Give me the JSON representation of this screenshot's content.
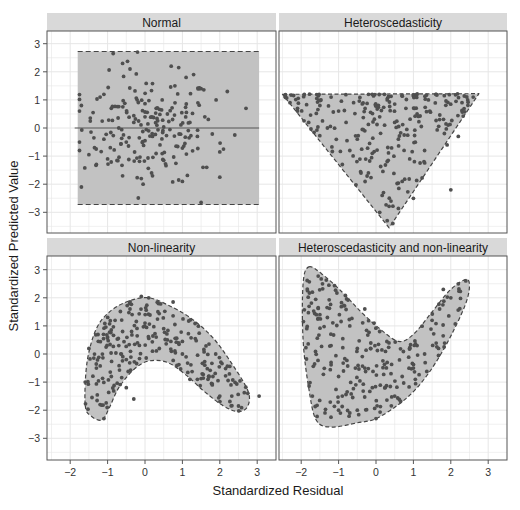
{
  "chart_data": {
    "type": "scatter",
    "layout": "facet_grid_2x2",
    "xlabel": "Standardized Residual",
    "ylabel": "Standardized Predicted Value",
    "x_ticks": [
      -2,
      -1,
      0,
      1,
      2,
      3
    ],
    "y_ticks": [
      3,
      2,
      1,
      0,
      -1,
      -2,
      -3
    ],
    "xlim": [
      -2.6,
      3.5
    ],
    "ylim": [
      -3.7,
      3.45
    ],
    "grid": true,
    "colors": {
      "strip_bg": "#d9d9d9",
      "grid": "#e6e6e6",
      "panel_border": "#555555",
      "region_fill": "#c2c2c2",
      "region_border": "#444444",
      "point": "#4f4f4f",
      "zero_line": "#555555"
    },
    "panels": [
      {
        "title": "Normal",
        "region_shape": "rectangle",
        "region": [
          [
            -1.8,
            2.72
          ],
          [
            3.05,
            2.72
          ],
          [
            3.05,
            -2.72
          ],
          [
            -1.8,
            -2.72
          ]
        ],
        "zero_line": true,
        "n_points": 220,
        "sample_points": [
          [
            -1.75,
            0.6
          ],
          [
            -1.7,
            0.8
          ],
          [
            -1.7,
            -2.1
          ],
          [
            -1.2,
            1.1
          ],
          [
            -1.1,
            1.2
          ],
          [
            -0.85,
            2.65
          ],
          [
            -0.6,
            2.3
          ],
          [
            -0.2,
            2.7
          ],
          [
            -0.4,
            2.1
          ],
          [
            0.7,
            2.2
          ],
          [
            0.9,
            2.15
          ],
          [
            1.3,
            1.9
          ],
          [
            1.1,
            1.8
          ],
          [
            0.8,
            1.5
          ],
          [
            1.5,
            1.4
          ],
          [
            2.7,
            0.7
          ],
          [
            2.2,
            1.3
          ],
          [
            1.9,
            1.0
          ],
          [
            2.4,
            -0.25
          ],
          [
            2.0,
            -0.85
          ],
          [
            2.1,
            -0.75
          ],
          [
            2.0,
            -1.75
          ],
          [
            1.65,
            -1.4
          ],
          [
            1.55,
            -1.4
          ],
          [
            0.9,
            -1.85
          ],
          [
            1.0,
            -1.9
          ],
          [
            -0.05,
            -2.0
          ],
          [
            -0.1,
            -1.8
          ],
          [
            0.2,
            -1.7
          ],
          [
            -0.6,
            -1.7
          ],
          [
            -1.3,
            -1.3
          ],
          [
            -1.5,
            -0.95
          ],
          [
            -1.35,
            -0.7
          ],
          [
            -1.0,
            -1.1
          ],
          [
            0.5,
            -1.15
          ],
          [
            1.5,
            -2.65
          ],
          [
            0.3,
            0.7
          ],
          [
            -0.3,
            0.2
          ],
          [
            0.1,
            -0.1
          ],
          [
            0.6,
            0.5
          ],
          [
            -0.7,
            0.0
          ],
          [
            1.2,
            0.2
          ],
          [
            0.4,
            -0.6
          ],
          [
            -0.5,
            -0.5
          ],
          [
            1.4,
            -0.3
          ],
          [
            -0.9,
            0.7
          ],
          [
            0.0,
            0.4
          ],
          [
            0.2,
            -0.3
          ],
          [
            -1.1,
            -0.4
          ],
          [
            1.6,
            0.4
          ]
        ]
      },
      {
        "title": "Heteroscedasticity",
        "region_shape": "inverted_triangle",
        "region": [
          [
            -2.5,
            1.2
          ],
          [
            2.75,
            1.22
          ],
          [
            0.35,
            -3.55
          ]
        ],
        "n_points": 250,
        "sample_points": [
          [
            -2.3,
            0.9
          ],
          [
            -2.1,
            0.7
          ],
          [
            -1.8,
            0.2
          ],
          [
            -1.5,
            0.8
          ],
          [
            -1.2,
            1.1
          ],
          [
            -1.0,
            0.6
          ],
          [
            -0.8,
            0.2
          ],
          [
            -0.5,
            -0.4
          ],
          [
            -0.7,
            -0.8
          ],
          [
            -0.9,
            -1.3
          ],
          [
            -0.4,
            -1.6
          ],
          [
            -0.1,
            -0.9
          ],
          [
            0.1,
            0.4
          ],
          [
            0.3,
            1.0
          ],
          [
            0.5,
            0.2
          ],
          [
            0.8,
            0.7
          ],
          [
            1.1,
            0.5
          ],
          [
            1.4,
            1.0
          ],
          [
            1.7,
            0.3
          ],
          [
            2.3,
            0.9
          ],
          [
            2.6,
            1.1
          ],
          [
            2.2,
            -0.3
          ],
          [
            1.9,
            -0.6
          ],
          [
            1.3,
            -0.8
          ],
          [
            0.9,
            -1.1
          ],
          [
            0.6,
            -0.4
          ],
          [
            0.2,
            -2.3
          ],
          [
            0.4,
            -2.6
          ],
          [
            0.1,
            -3.0
          ],
          [
            0.3,
            -3.3
          ],
          [
            0.45,
            -3.4
          ],
          [
            2.0,
            -2.2
          ],
          [
            -0.2,
            1.2
          ],
          [
            0.0,
            0.8
          ],
          [
            -1.3,
            0.0
          ],
          [
            -0.3,
            -0.1
          ],
          [
            0.7,
            -1.9
          ],
          [
            1.0,
            -2.5
          ],
          [
            -0.6,
            0.9
          ],
          [
            1.6,
            1.2
          ]
        ]
      },
      {
        "title": "Non-linearity",
        "region_shape": "curved_band_arch",
        "region": [
          [
            -1.6,
            -1.8
          ],
          [
            -1.55,
            -0.3
          ],
          [
            -1.3,
            0.9
          ],
          [
            -0.9,
            1.55
          ],
          [
            -0.4,
            1.9
          ],
          [
            0.1,
            2.0
          ],
          [
            0.6,
            1.75
          ],
          [
            1.2,
            1.3
          ],
          [
            1.8,
            0.6
          ],
          [
            2.3,
            -0.3
          ],
          [
            2.75,
            -1.3
          ],
          [
            2.75,
            -1.85
          ],
          [
            2.5,
            -2.05
          ],
          [
            2.1,
            -1.85
          ],
          [
            1.6,
            -1.35
          ],
          [
            1.1,
            -0.75
          ],
          [
            0.6,
            -0.3
          ],
          [
            0.1,
            -0.25
          ],
          [
            -0.3,
            -0.55
          ],
          [
            -0.7,
            -1.2
          ],
          [
            -0.95,
            -1.9
          ],
          [
            -1.15,
            -2.35
          ],
          [
            -1.45,
            -2.2
          ]
        ],
        "n_points": 250,
        "sample_points": [
          [
            -1.6,
            -1.0
          ],
          [
            -1.5,
            0.2
          ],
          [
            -1.3,
            -0.5
          ],
          [
            -1.2,
            -1.8
          ],
          [
            -1.1,
            -2.3
          ],
          [
            -1.0,
            0.6
          ],
          [
            -0.9,
            -0.8
          ],
          [
            -0.8,
            1.2
          ],
          [
            -0.7,
            0.3
          ],
          [
            -0.5,
            -1.2
          ],
          [
            -0.3,
            -1.6
          ],
          [
            -0.4,
            1.6
          ],
          [
            -0.1,
            2.05
          ],
          [
            0.1,
            2.0
          ],
          [
            0.0,
            1.1
          ],
          [
            0.3,
            0.6
          ],
          [
            0.5,
            0.9
          ],
          [
            0.8,
            1.05
          ],
          [
            0.75,
            1.85
          ],
          [
            0.9,
            0.4
          ],
          [
            1.1,
            -0.1
          ],
          [
            1.2,
            -0.9
          ],
          [
            1.4,
            -0.9
          ],
          [
            1.6,
            -0.4
          ],
          [
            1.8,
            -1.1
          ],
          [
            2.0,
            -1.5
          ],
          [
            2.3,
            -1.1
          ],
          [
            2.5,
            -1.85
          ],
          [
            2.75,
            -1.4
          ],
          [
            3.05,
            -1.5
          ],
          [
            -0.6,
            0.8
          ],
          [
            0.2,
            0.1
          ],
          [
            0.6,
            0.5
          ],
          [
            -0.2,
            0.4
          ],
          [
            1.0,
            0.0
          ]
        ]
      },
      {
        "title": "Heteroscedasticity and non-linearity",
        "region_shape": "curved_v",
        "region": [
          [
            -1.8,
            3.1
          ],
          [
            -1.45,
            2.85
          ],
          [
            -0.9,
            2.2
          ],
          [
            -0.4,
            1.5
          ],
          [
            0.1,
            0.9
          ],
          [
            0.6,
            0.45
          ],
          [
            1.0,
            0.7
          ],
          [
            1.5,
            1.5
          ],
          [
            2.0,
            2.3
          ],
          [
            2.45,
            2.65
          ],
          [
            2.45,
            2.0
          ],
          [
            2.1,
            0.9
          ],
          [
            1.6,
            -0.3
          ],
          [
            1.1,
            -1.2
          ],
          [
            0.6,
            -1.8
          ],
          [
            0.0,
            -2.3
          ],
          [
            -0.5,
            -2.45
          ],
          [
            -1.2,
            -2.6
          ],
          [
            -1.6,
            -2.35
          ],
          [
            -1.8,
            -1.2
          ],
          [
            -1.95,
            0.5
          ],
          [
            -1.95,
            2.5
          ]
        ],
        "n_points": 250,
        "sample_points": [
          [
            -1.85,
            0.9
          ],
          [
            -1.7,
            2.2
          ],
          [
            -1.7,
            -1.5
          ],
          [
            -1.5,
            1.4
          ],
          [
            -1.3,
            1.3
          ],
          [
            -1.2,
            0.3
          ],
          [
            -1.0,
            -0.8
          ],
          [
            -1.0,
            -2.0
          ],
          [
            -0.9,
            -1.5
          ],
          [
            -0.7,
            1.0
          ],
          [
            -0.5,
            0.2
          ],
          [
            -0.3,
            -0.5
          ],
          [
            -0.3,
            1.6
          ],
          [
            -0.1,
            -1.2
          ],
          [
            0.1,
            0.8
          ],
          [
            0.3,
            -0.3
          ],
          [
            0.5,
            -1.5
          ],
          [
            0.7,
            -0.8
          ],
          [
            0.9,
            0.2
          ],
          [
            1.1,
            0.3
          ],
          [
            1.05,
            -0.9
          ],
          [
            1.3,
            0.0
          ],
          [
            1.5,
            1.2
          ],
          [
            1.7,
            1.6
          ],
          [
            1.8,
            2.3
          ],
          [
            2.0,
            2.0
          ],
          [
            2.2,
            2.5
          ],
          [
            2.4,
            2.6
          ],
          [
            0.0,
            -2.3
          ],
          [
            -0.5,
            -2.0
          ],
          [
            -0.7,
            -2.1
          ],
          [
            -0.05,
            1.1
          ],
          [
            0.4,
            -0.7
          ],
          [
            1.0,
            -0.5
          ],
          [
            -1.2,
            -0.3
          ]
        ]
      }
    ]
  }
}
